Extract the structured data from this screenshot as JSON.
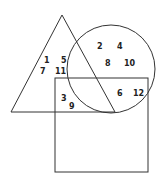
{
  "diagram": {
    "type": "venn",
    "shapes": [
      {
        "name": "triangle",
        "points": [
          [
            62,
            15
          ],
          [
            11,
            112
          ],
          [
            115,
            112
          ]
        ]
      },
      {
        "name": "circle",
        "cx": 111,
        "cy": 69,
        "r": 44
      },
      {
        "name": "rectangle",
        "x": 55,
        "y": 78,
        "w": 93,
        "h": 94
      }
    ],
    "stroke_color": "#333333",
    "labels": [
      {
        "text": "1",
        "x": 44,
        "y": 63,
        "region": "triangle only"
      },
      {
        "text": "5",
        "x": 61,
        "y": 63,
        "region": "triangle only"
      },
      {
        "text": "7",
        "x": 40,
        "y": 74,
        "region": "triangle only"
      },
      {
        "text": "11",
        "x": 55,
        "y": 74,
        "region": "triangle only"
      },
      {
        "text": "2",
        "x": 97,
        "y": 49,
        "region": "circle only"
      },
      {
        "text": "4",
        "x": 117,
        "y": 49,
        "region": "circle only"
      },
      {
        "text": "8",
        "x": 105,
        "y": 66,
        "region": "circle only"
      },
      {
        "text": "10",
        "x": 124,
        "y": 66,
        "region": "circle only"
      },
      {
        "text": "3",
        "x": 61,
        "y": 101,
        "region": "triangle and rectangle"
      },
      {
        "text": "9",
        "x": 69,
        "y": 109,
        "region": "triangle and rectangle"
      },
      {
        "text": "6",
        "x": 117,
        "y": 96,
        "region": "circle and rectangle"
      },
      {
        "text": "12",
        "x": 133,
        "y": 96,
        "region": "circle and rectangle"
      }
    ]
  }
}
